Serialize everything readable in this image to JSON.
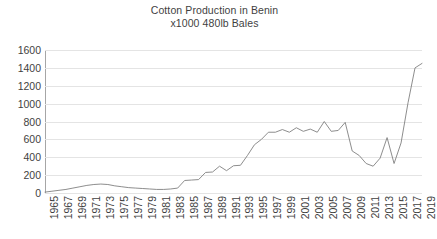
{
  "chart_data": {
    "type": "line",
    "title": "Cotton Production in Benin",
    "subtitle": "x1000  480lb Bales",
    "xlabel": "",
    "ylabel": "",
    "ylim": [
      0,
      1600
    ],
    "ytick_step": 200,
    "yticks": [
      1600,
      1400,
      1200,
      1000,
      800,
      600,
      400,
      200,
      0
    ],
    "grid": true,
    "legend": "none",
    "line_color": "#808080",
    "xlim": [
      1965,
      2019
    ],
    "xtick_step": 2,
    "xticks": [
      1965,
      1967,
      1969,
      1971,
      1973,
      1975,
      1977,
      1979,
      1981,
      1983,
      1985,
      1987,
      1989,
      1991,
      1993,
      1995,
      1997,
      1999,
      2001,
      2003,
      2005,
      2007,
      2009,
      2011,
      2013,
      2015,
      2017,
      2019
    ],
    "x": [
      1965,
      1966,
      1967,
      1968,
      1969,
      1970,
      1971,
      1972,
      1973,
      1974,
      1975,
      1976,
      1977,
      1978,
      1979,
      1980,
      1981,
      1982,
      1983,
      1984,
      1985,
      1986,
      1987,
      1988,
      1989,
      1990,
      1991,
      1992,
      1993,
      1994,
      1995,
      1996,
      1997,
      1998,
      1999,
      2000,
      2001,
      2002,
      2003,
      2004,
      2005,
      2006,
      2007,
      2008,
      2009,
      2010,
      2011,
      2012,
      2013,
      2014,
      2015,
      2016,
      2017,
      2018,
      2019
    ],
    "values": [
      10,
      20,
      30,
      40,
      55,
      70,
      85,
      95,
      100,
      95,
      80,
      70,
      60,
      55,
      50,
      45,
      40,
      40,
      45,
      55,
      140,
      145,
      150,
      230,
      235,
      300,
      250,
      305,
      310,
      420,
      540,
      600,
      680,
      680,
      710,
      680,
      730,
      690,
      715,
      680,
      800,
      690,
      700,
      790,
      470,
      420,
      330,
      300,
      390,
      620,
      330,
      560,
      1010,
      1400,
      1450
    ],
    "series": [
      {
        "name": "Cotton Production",
        "values": [
          10,
          20,
          30,
          40,
          55,
          70,
          85,
          95,
          100,
          95,
          80,
          70,
          60,
          55,
          50,
          45,
          40,
          40,
          45,
          55,
          140,
          145,
          150,
          230,
          235,
          300,
          250,
          305,
          310,
          420,
          540,
          600,
          680,
          680,
          710,
          680,
          730,
          690,
          715,
          680,
          800,
          690,
          700,
          790,
          470,
          420,
          330,
          300,
          390,
          620,
          330,
          560,
          1010,
          1400,
          1450
        ]
      }
    ]
  }
}
